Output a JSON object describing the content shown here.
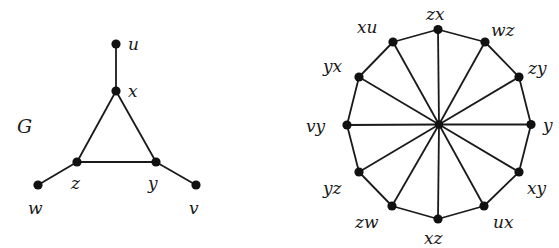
{
  "graph_g": {
    "name": "G",
    "name_pos": [
      17,
      133
    ],
    "vertices": [
      {
        "id": "u",
        "label": "u",
        "x": 116,
        "y": 44,
        "lx": 128,
        "ly": 50
      },
      {
        "id": "x",
        "label": "x",
        "x": 116,
        "y": 91,
        "lx": 128,
        "ly": 97
      },
      {
        "id": "z",
        "label": "z",
        "x": 77,
        "y": 162,
        "lx": 71,
        "ly": 189
      },
      {
        "id": "y",
        "label": "y",
        "x": 156,
        "y": 162,
        "lx": 148,
        "ly": 189
      },
      {
        "id": "w",
        "label": "w",
        "x": 38,
        "y": 185,
        "lx": 28,
        "ly": 214
      },
      {
        "id": "v",
        "label": "v",
        "x": 196,
        "y": 185,
        "lx": 189,
        "ly": 214
      }
    ],
    "edges": [
      [
        "u",
        "x"
      ],
      [
        "x",
        "z"
      ],
      [
        "x",
        "y"
      ],
      [
        "z",
        "y"
      ],
      [
        "z",
        "w"
      ],
      [
        "y",
        "v"
      ]
    ]
  },
  "graph_h": {
    "center": {
      "x": 439,
      "y": 124.5
    },
    "vertices": [
      {
        "id": "zx",
        "label": "zx",
        "x": 438,
        "y": 29.5,
        "lx": 426,
        "ly": 20
      },
      {
        "id": "wz",
        "label": "wz",
        "x": 485,
        "y": 42,
        "lx": 491,
        "ly": 36
      },
      {
        "id": "zy",
        "label": "zy",
        "x": 519,
        "y": 77,
        "lx": 528,
        "ly": 74
      },
      {
        "id": "yv",
        "label": "y",
        "x": 531,
        "y": 124.5,
        "lx": 543,
        "ly": 131
      },
      {
        "id": "xy",
        "label": "xy",
        "x": 519,
        "y": 172,
        "lx": 527,
        "ly": 194
      },
      {
        "id": "ux",
        "label": "ux",
        "x": 484,
        "y": 206,
        "lx": 493,
        "ly": 228
      },
      {
        "id": "xz",
        "label": "xz",
        "x": 438,
        "y": 219,
        "lx": 424,
        "ly": 244
      },
      {
        "id": "zw",
        "label": "zw",
        "x": 392,
        "y": 206,
        "lx": 355,
        "ly": 228
      },
      {
        "id": "yz",
        "label": "yz",
        "x": 359,
        "y": 172,
        "lx": 323,
        "ly": 194
      },
      {
        "id": "vy",
        "label": "vy",
        "x": 347,
        "y": 125,
        "lx": 306,
        "ly": 132
      },
      {
        "id": "yx",
        "label": "yx",
        "x": 359,
        "y": 77,
        "lx": 323,
        "ly": 72
      },
      {
        "id": "xu",
        "label": "xu",
        "x": 393,
        "y": 42,
        "lx": 357,
        "ly": 33
      }
    ]
  },
  "colors": {
    "line": "#1a1a1a",
    "node": "#111111",
    "background": "#ffffff"
  }
}
